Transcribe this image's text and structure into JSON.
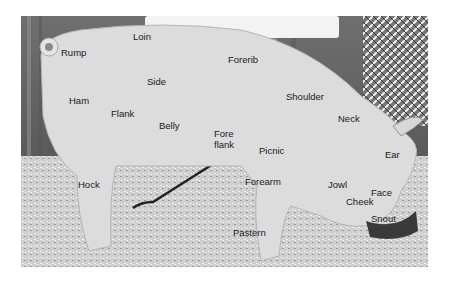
{
  "figure": {
    "labels": [
      {
        "id": "loin",
        "text": "Loin"
      },
      {
        "id": "rump",
        "text": "Rump"
      },
      {
        "id": "forerib",
        "text": "Forerib"
      },
      {
        "id": "side",
        "text": "Side"
      },
      {
        "id": "ham",
        "text": "Ham"
      },
      {
        "id": "shoulder",
        "text": "Shoulder"
      },
      {
        "id": "flank",
        "text": "Flank"
      },
      {
        "id": "belly",
        "text": "Belly"
      },
      {
        "id": "neck",
        "text": "Neck"
      },
      {
        "id": "fore",
        "text": "Fore"
      },
      {
        "id": "flank2",
        "text": "flank"
      },
      {
        "id": "picnic",
        "text": "Picnic"
      },
      {
        "id": "ear",
        "text": "Ear"
      },
      {
        "id": "hock",
        "text": "Hock"
      },
      {
        "id": "forearm",
        "text": "Forearm"
      },
      {
        "id": "jowl",
        "text": "Jowl"
      },
      {
        "id": "face",
        "text": "Face"
      },
      {
        "id": "cheek",
        "text": "Cheek"
      },
      {
        "id": "snout",
        "text": "Snout"
      },
      {
        "id": "pastern",
        "text": "Pastern"
      }
    ]
  }
}
